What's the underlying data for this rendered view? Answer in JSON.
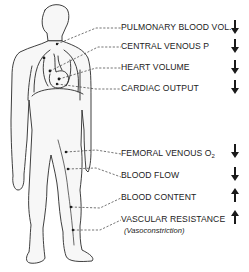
{
  "diagram": {
    "type": "anatomical-figure-with-callouts",
    "figure": "human-body-outline",
    "colors": {
      "line": "#2a2a2a",
      "background": "#ffffff"
    },
    "callouts": [
      {
        "label": "PULMONARY BLOOD VOL.",
        "direction": "down",
        "region": "lungs"
      },
      {
        "label": "CENTRAL VENOUS P",
        "direction": "down",
        "region": "central-veins"
      },
      {
        "label": "HEART VOLUME",
        "direction": "down",
        "region": "heart"
      },
      {
        "label": "CARDIAC OUTPUT",
        "direction": "down",
        "region": "heart"
      },
      {
        "label": "FEMORAL VENOUS O",
        "subscript": "2",
        "direction": "down",
        "region": "thigh"
      },
      {
        "label": "BLOOD FLOW",
        "direction": "down",
        "region": "leg"
      },
      {
        "label": "BLOOD CONTENT",
        "direction": "up",
        "region": "lower-leg"
      },
      {
        "label": "VASCULAR RESISTANCE",
        "note": "(Vasoconstriction)",
        "direction": "up",
        "region": "lower-leg"
      }
    ]
  }
}
